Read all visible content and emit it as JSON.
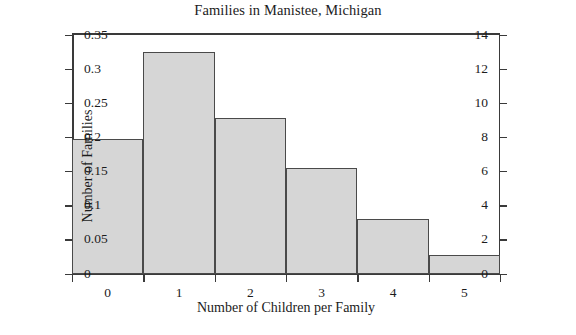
{
  "chart_data": {
    "type": "bar",
    "title": "Families in Manistee, Michigan",
    "xlabel": "Number of Children per Family",
    "ylabel": "Number of Families",
    "ylabel_secondary": "Relative Frequency",
    "categories": [
      "0",
      "1",
      "2",
      "3",
      "4",
      "5"
    ],
    "values": [
      7.9,
      13,
      9.1,
      6.2,
      3.2,
      1.1
    ],
    "relative_frequency": [
      0.1975,
      0.325,
      0.2275,
      0.155,
      0.08,
      0.0275
    ],
    "ylim": [
      0,
      14
    ],
    "ylim_secondary": [
      0,
      0.35
    ],
    "xlim": [
      -0.5,
      5.5
    ],
    "yticks": [
      "0",
      "2",
      "4",
      "6",
      "8",
      "10",
      "12",
      "14"
    ],
    "ytick_values": [
      0,
      2,
      4,
      6,
      8,
      10,
      12,
      14
    ],
    "yticks_secondary": [
      "0",
      "0.05",
      "0.1",
      "0.15",
      "0.2",
      "0.25",
      "0.3",
      "0.35"
    ],
    "ytick_values_secondary": [
      0,
      0.05,
      0.1,
      0.15,
      0.2,
      0.25,
      0.3,
      0.35
    ],
    "xtick_boundaries": [
      -0.5,
      0.5,
      1.5,
      2.5,
      3.5,
      4.5,
      5.5
    ],
    "grid": false,
    "legend": false,
    "bar_fill_color": "#d6d6d6",
    "bar_edge_color": "#4a4a4a",
    "axis_color": "#3a3a3a",
    "background_color": "#ffffff"
  }
}
